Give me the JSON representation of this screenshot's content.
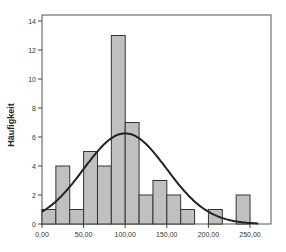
{
  "chart_data": {
    "type": "bar",
    "subtype": "histogram_with_normal_curve",
    "title": "",
    "xlabel": "",
    "ylabel": "Häufigkeit",
    "bin_width": 16.67,
    "bin_start": 0,
    "categories": [
      "0-16.7",
      "16.7-33.3",
      "33.3-50",
      "50-66.7",
      "66.7-83.3",
      "83.3-100",
      "100-116.7",
      "116.7-133.3",
      "133.3-150",
      "150-166.7",
      "166.7-183.3",
      "183.3-200",
      "200-216.7",
      "216.7-233.3",
      "233.3-250"
    ],
    "values": [
      1,
      4,
      1,
      5,
      4,
      13,
      7,
      2,
      3,
      2,
      1,
      0,
      1,
      0,
      2
    ],
    "normal_curve": {
      "mean": 100,
      "peak": 6.25
    },
    "xlim": [
      0,
      275
    ],
    "ylim": [
      0,
      14.5
    ],
    "x_ticks": [
      "0,00",
      "50,00",
      "100,00",
      "150,00",
      "200,00",
      "250,00"
    ],
    "x_tick_values": [
      0,
      50,
      100,
      150,
      200,
      250
    ],
    "y_ticks": [
      "0",
      "2",
      "4",
      "6",
      "8",
      "10",
      "12",
      "14"
    ],
    "y_tick_values": [
      0,
      2,
      4,
      6,
      8,
      10,
      12,
      14
    ],
    "grid": false,
    "legend": "none",
    "colors": {
      "bar_fill": "#c0c0c0",
      "bar_stroke": "#333333",
      "curve": "#222222",
      "frame": "#444444"
    }
  }
}
